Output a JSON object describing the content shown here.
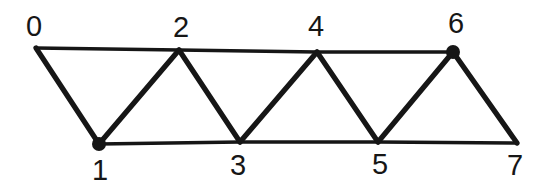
{
  "figure": {
    "background_color": "#ffffff",
    "stroke_color": "#161616",
    "dot_color": "#161616",
    "chord_stroke_width": 3.6,
    "diagonal_stroke_width": 5.2,
    "dot_radius": 7,
    "width": 555,
    "height": 187,
    "nodes": [
      {
        "id": 0,
        "label": "0",
        "x": 36,
        "y": 48,
        "label_x": 34,
        "label_y": 26,
        "marked": false
      },
      {
        "id": 1,
        "label": "1",
        "x": 99,
        "y": 144,
        "label_x": 100,
        "label_y": 170,
        "marked": true
      },
      {
        "id": 2,
        "label": "2",
        "x": 179,
        "y": 50,
        "label_x": 181,
        "label_y": 27,
        "marked": false
      },
      {
        "id": 3,
        "label": "3",
        "x": 240,
        "y": 142,
        "label_x": 238,
        "label_y": 165,
        "marked": false
      },
      {
        "id": 4,
        "label": "4",
        "x": 317,
        "y": 52,
        "label_x": 316,
        "label_y": 26,
        "marked": false
      },
      {
        "id": 5,
        "label": "5",
        "x": 378,
        "y": 142,
        "label_x": 380,
        "label_y": 164,
        "marked": false
      },
      {
        "id": 6,
        "label": "6",
        "x": 453,
        "y": 52,
        "label_x": 456,
        "label_y": 23,
        "marked": true
      },
      {
        "id": 7,
        "label": "7",
        "x": 517,
        "y": 143,
        "label_x": 515,
        "label_y": 165,
        "marked": false
      }
    ],
    "edges": [
      {
        "from": 0,
        "to": 2,
        "type": "chord"
      },
      {
        "from": 2,
        "to": 4,
        "type": "chord"
      },
      {
        "from": 4,
        "to": 6,
        "type": "chord"
      },
      {
        "from": 1,
        "to": 3,
        "type": "chord"
      },
      {
        "from": 3,
        "to": 5,
        "type": "chord"
      },
      {
        "from": 5,
        "to": 7,
        "type": "chord"
      },
      {
        "from": 0,
        "to": 1,
        "type": "diagonal"
      },
      {
        "from": 1,
        "to": 2,
        "type": "diagonal"
      },
      {
        "from": 2,
        "to": 3,
        "type": "diagonal"
      },
      {
        "from": 3,
        "to": 4,
        "type": "diagonal"
      },
      {
        "from": 4,
        "to": 5,
        "type": "diagonal"
      },
      {
        "from": 5,
        "to": 6,
        "type": "diagonal"
      },
      {
        "from": 6,
        "to": 7,
        "type": "diagonal"
      }
    ]
  }
}
